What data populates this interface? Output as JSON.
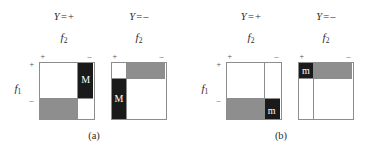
{
  "figure": {
    "axis_labels": {
      "f1": "f",
      "f1_sub": "1",
      "f2": "f",
      "f2_sub": "2"
    },
    "ticks": {
      "plus": "+",
      "minus": "–"
    },
    "class_labels": {
      "variable": "Y",
      "equals": "=",
      "positive": "+",
      "negative": "–"
    },
    "panels": [
      {
        "id": "a",
        "caption": "(a)",
        "subpanels": [
          {
            "id": "a-pos",
            "class_label": "Y = +",
            "col_split_pct": 71,
            "row_split_pct": 64,
            "quadrants": [
              {
                "pos": "tl",
                "fill": "white",
                "letter": ""
              },
              {
                "pos": "tr",
                "fill": "black",
                "letter": "M"
              },
              {
                "pos": "bl",
                "fill": "gray",
                "letter": ""
              },
              {
                "pos": "br",
                "fill": "white",
                "letter": ""
              }
            ]
          },
          {
            "id": "a-neg",
            "class_label": "Y = –",
            "col_split_pct": 29,
            "row_split_pct": 29,
            "quadrants": [
              {
                "pos": "tl",
                "fill": "white",
                "letter": ""
              },
              {
                "pos": "tr",
                "fill": "gray",
                "letter": ""
              },
              {
                "pos": "bl",
                "fill": "black",
                "letter": "M"
              },
              {
                "pos": "br",
                "fill": "white",
                "letter": ""
              }
            ]
          }
        ]
      },
      {
        "id": "b",
        "caption": "(b)",
        "subpanels": [
          {
            "id": "b-pos",
            "class_label": "Y = +",
            "col_split_pct": 71,
            "row_split_pct": 64,
            "quadrants": [
              {
                "pos": "tl",
                "fill": "white",
                "letter": ""
              },
              {
                "pos": "tr",
                "fill": "white",
                "letter": ""
              },
              {
                "pos": "bl",
                "fill": "gray",
                "letter": ""
              },
              {
                "pos": "br",
                "fill": "black",
                "letter": "m"
              }
            ]
          },
          {
            "id": "b-neg",
            "class_label": "Y = –",
            "col_split_pct": 29,
            "row_split_pct": 29,
            "quadrants": [
              {
                "pos": "tl",
                "fill": "black",
                "letter": "m"
              },
              {
                "pos": "tr",
                "fill": "gray",
                "letter": ""
              },
              {
                "pos": "bl",
                "fill": "white",
                "letter": ""
              },
              {
                "pos": "br",
                "fill": "white",
                "letter": ""
              }
            ]
          }
        ]
      }
    ],
    "colors": {
      "white": "#ffffff",
      "gray": "#8e8e8e",
      "black": "#1a1a1a",
      "line": "#8d8d8d",
      "text": "#2b2b2b"
    }
  }
}
